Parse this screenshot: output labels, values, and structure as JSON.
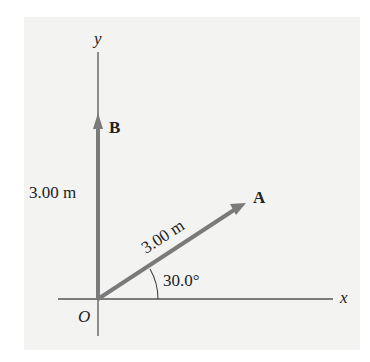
{
  "diagram": {
    "type": "vector-diagram",
    "axes": {
      "x_label": "x",
      "y_label": "y",
      "origin_label": "O"
    },
    "vectors": [
      {
        "name": "A",
        "magnitude_label": "3.00 m",
        "magnitude": 3.0,
        "unit": "m",
        "angle_deg": 30.0,
        "angle_label": "30.0°",
        "reference": "positive x-axis"
      },
      {
        "name": "B",
        "magnitude_label": "3.00 m",
        "magnitude": 3.0,
        "unit": "m",
        "direction": "positive y-axis"
      }
    ],
    "colors": {
      "panel_background": "#f3f3f2",
      "page_background": "#ffffff",
      "vector": "#7a7a7a",
      "axis": "#555555",
      "text": "#222222"
    }
  }
}
